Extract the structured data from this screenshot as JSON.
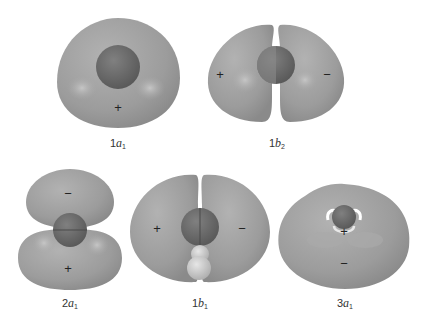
{
  "figure": {
    "colors": {
      "lobe": "#9a9a9a",
      "lobe_light": "#b4b4b4",
      "oxygen": "#6e6e6e",
      "hydrogen": "#c8c8c8",
      "sign": "#222222",
      "label": "#333333"
    },
    "orbitals": [
      {
        "id": "1a1",
        "prefix": "1",
        "letter": "a",
        "sub": "1",
        "signs": [
          "+"
        ]
      },
      {
        "id": "1b2",
        "prefix": "1",
        "letter": "b",
        "sub": "2",
        "signs": [
          "+",
          "−"
        ]
      },
      {
        "id": "2a1",
        "prefix": "2",
        "letter": "a",
        "sub": "1",
        "signs": [
          "−",
          "+"
        ]
      },
      {
        "id": "1b1",
        "prefix": "1",
        "letter": "b",
        "sub": "1",
        "signs": [
          "+",
          "−"
        ]
      },
      {
        "id": "3a1",
        "prefix": "3",
        "letter": "a",
        "sub": "1",
        "signs": [
          "+",
          "−"
        ]
      }
    ]
  }
}
